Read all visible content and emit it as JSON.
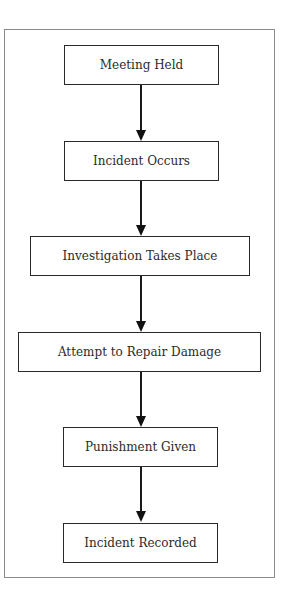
{
  "diagram": {
    "type": "flowchart",
    "direction": "top-to-bottom",
    "nodes": [
      {
        "id": "n1",
        "label": "Meeting Held"
      },
      {
        "id": "n2",
        "label": "Incident Occurs"
      },
      {
        "id": "n3",
        "label": "Investigation Takes Place"
      },
      {
        "id": "n4",
        "label": "Attempt to Repair Damage"
      },
      {
        "id": "n5",
        "label": "Punishment Given"
      },
      {
        "id": "n6",
        "label": "Incident Recorded"
      }
    ],
    "edges": [
      {
        "from": "n1",
        "to": "n2"
      },
      {
        "from": "n2",
        "to": "n3"
      },
      {
        "from": "n3",
        "to": "n4"
      },
      {
        "from": "n4",
        "to": "n5"
      },
      {
        "from": "n5",
        "to": "n6"
      }
    ]
  },
  "colors": {
    "border": "#2a2a2a",
    "frame": "#8a8a8a",
    "text": "#2b2b2b",
    "background": "#ffffff"
  }
}
